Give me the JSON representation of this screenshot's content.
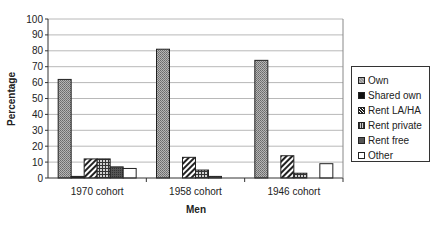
{
  "chart_data": {
    "type": "bar",
    "title": "",
    "xlabel": "Men",
    "ylabel": "Percentage",
    "ylim": [
      0,
      100
    ],
    "yticks": [
      0,
      10,
      20,
      30,
      40,
      50,
      60,
      70,
      80,
      90,
      100
    ],
    "grid": true,
    "legend_position": "right",
    "categories": [
      "1970 cohort",
      "1958 cohort",
      "1946 cohort"
    ],
    "series": [
      {
        "name": "Own",
        "values": [
          62,
          81,
          74
        ],
        "pattern": "dots",
        "color": "#9a9a9a"
      },
      {
        "name": "Shared own",
        "values": [
          1,
          0,
          0
        ],
        "pattern": "solid",
        "color": "#111111"
      },
      {
        "name": "Rent LA/HA",
        "values": [
          12,
          13,
          14
        ],
        "pattern": "diagonal",
        "color": "#555555"
      },
      {
        "name": "Rent private",
        "values": [
          12,
          5,
          3
        ],
        "pattern": "grid",
        "color": "#666666"
      },
      {
        "name": "Rent free",
        "values": [
          7,
          1,
          0
        ],
        "pattern": "dark",
        "color": "#444444"
      },
      {
        "name": "Other",
        "values": [
          6,
          0,
          9
        ],
        "pattern": "white",
        "color": "#ffffff"
      }
    ]
  }
}
